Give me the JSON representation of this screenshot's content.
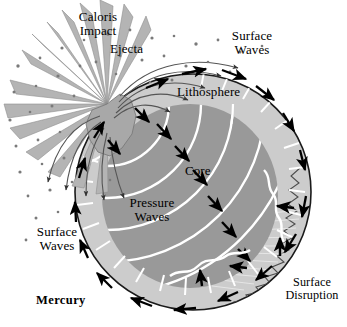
{
  "figure": {
    "subject": "Mercury"
  },
  "labels": {
    "caloris_impact": "Caloris\nImpact",
    "ejecta": "Ejecta",
    "surface_waves_top": "Surface\nWaves",
    "lithosphere": "Lithosphere",
    "core": "Core",
    "pressure_waves": "Pressure\nWaves",
    "surface_waves_left": "Surface\nWaves",
    "surface_disruption": "Surface\nDisruption",
    "mercury": "Mercury"
  },
  "colors": {
    "background": "#ffffff",
    "lithosphere_fill": "#cccccc",
    "core_fill": "#999999",
    "crater_fill": "#a8a8a8",
    "spike_fill": "#b4b4b4",
    "outline": "#1a1a1a",
    "wave_line": "#ffffff",
    "arrow": "#000000",
    "debris": "#808080"
  },
  "geometry": {
    "planet_center_x": 193,
    "planet_center_y": 192,
    "planet_radius": 118,
    "core_center_x": 190,
    "core_center_y": 196,
    "core_radius_x": 88,
    "core_radius_y": 92,
    "impact_x": 107,
    "impact_y": 104
  },
  "elements": {
    "impact_crater": "caloris-impact-crater",
    "ejecta_arcs": "ejecta-trajectory-arcs",
    "debris_field": "ejecta-debris-particles",
    "pressure_wave_fronts": "pressure-wave-arcs",
    "surface_wave_arrows": "surface-wave-arrows",
    "antipode_disruption": "antipodal-surface-disruption"
  }
}
